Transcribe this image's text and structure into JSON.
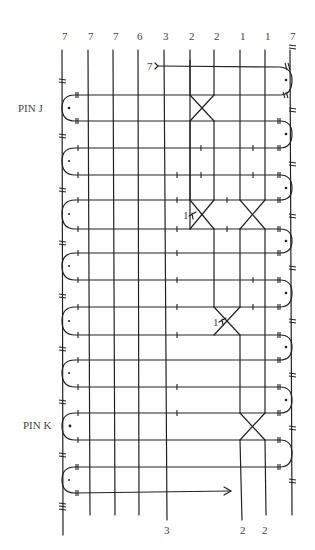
{
  "diagram": {
    "type": "thread-path diagram",
    "column_labels_top": [
      "7",
      "7",
      "7",
      "6",
      "3",
      "2",
      "2",
      "1",
      "1",
      "7"
    ],
    "column_labels_bottom": [
      {
        "col": 4,
        "label": "3"
      },
      {
        "col": 7,
        "label": "2"
      },
      {
        "col": 8,
        "label": "2"
      }
    ],
    "start_marker": "7",
    "pin_labels": [
      {
        "label": "PIN J",
        "row": 1
      },
      {
        "label": "PIN K",
        "row": 13
      }
    ],
    "crossing_labels": [
      {
        "label": "1",
        "position": "left crossing, rows 5-6"
      },
      {
        "label": "1",
        "position": "crossing, rows 9-10"
      }
    ]
  },
  "labels": {
    "top": [
      "7",
      "7",
      "7",
      "6",
      "3",
      "2",
      "2",
      "1",
      "1",
      "7"
    ],
    "start": "7",
    "pin_j": "PIN J",
    "pin_k": "PIN K",
    "cross_1a": "1",
    "cross_1b": "1",
    "bottom_3": "3",
    "bottom_2a": "2",
    "bottom_2b": "2"
  }
}
